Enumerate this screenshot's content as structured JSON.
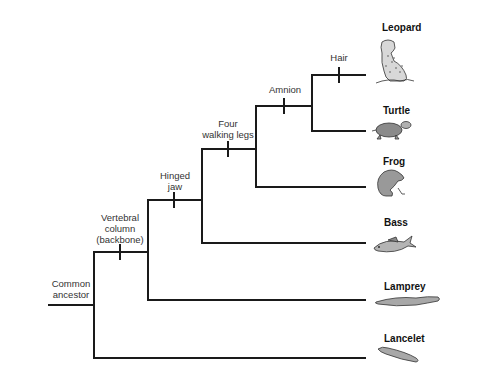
{
  "diagram": {
    "type": "cladogram",
    "root_label": [
      "Common",
      "ancestor"
    ],
    "characters": [
      {
        "id": "vertebral",
        "lines": [
          "Vertebral",
          "column",
          "(backbone)"
        ]
      },
      {
        "id": "jaw",
        "lines": [
          "Hinged",
          "jaw"
        ]
      },
      {
        "id": "legs",
        "lines": [
          "Four",
          "walking legs"
        ]
      },
      {
        "id": "amnion",
        "lines": [
          "Amnion"
        ]
      },
      {
        "id": "hair",
        "lines": [
          "Hair"
        ]
      }
    ],
    "taxa": [
      {
        "name": "Leopard",
        "icon": "leopard-icon"
      },
      {
        "name": "Turtle",
        "icon": "turtle-icon"
      },
      {
        "name": "Frog",
        "icon": "frog-icon"
      },
      {
        "name": "Bass",
        "icon": "bass-icon"
      },
      {
        "name": "Lamprey",
        "icon": "lamprey-icon"
      },
      {
        "name": "Lancelet",
        "icon": "lancelet-icon"
      }
    ],
    "colors": {
      "line": "#1a1a1a",
      "animal_fill": "#9a9a9a",
      "animal_stroke": "#333333"
    }
  }
}
